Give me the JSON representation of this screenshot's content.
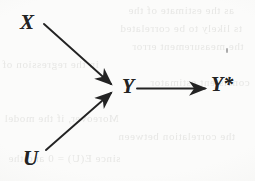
{
  "figure": {
    "kind": "causal-path-diagram",
    "background_color": "#fbfbfa",
    "ink_color": "#232323",
    "ghost_color": "#e6e6e4"
  },
  "nodes": [
    {
      "id": "x",
      "label": "X",
      "x": 30,
      "y": 22
    },
    {
      "id": "u",
      "label": "U",
      "x": 33,
      "y": 160
    },
    {
      "id": "y",
      "label": "Y",
      "x": 128,
      "y": 88
    },
    {
      "id": "ystar",
      "label": "Y*",
      "x": 224,
      "y": 84
    }
  ],
  "edges": [
    {
      "id": "x-to-y",
      "from": "X",
      "to": "Y",
      "label": "",
      "x1": 44,
      "y1": 24,
      "x2": 113,
      "y2": 85
    },
    {
      "id": "u-to-y",
      "from": "U",
      "to": "Y",
      "label": "",
      "x1": 46,
      "y1": 150,
      "x2": 113,
      "y2": 93
    },
    {
      "id": "y-to-ystar",
      "from": "Y",
      "to": "Y*",
      "label": "",
      "x1": 137,
      "y1": 88,
      "x2": 207,
      "y2": 88
    }
  ],
  "artifacts": {
    "speck_label": "scan-speck",
    "ghost_lines": [
      "as the estimate of the",
      "ts likely to be correlated",
      "the measurement error",
      "in the regression of",
      "consistent estimator",
      "Moreover, if the model",
      "the correlation between",
      "since E(U) = 0 and the"
    ]
  }
}
